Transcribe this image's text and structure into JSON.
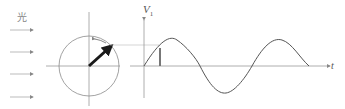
{
  "labels": {
    "light": "光",
    "voltage": "V",
    "voltage_subscript": "1",
    "time": "t"
  },
  "colors": {
    "axis": "#9a9a9a",
    "curve": "#555555",
    "phasor": "#1a1a1a",
    "circle": "#8a8a8a"
  },
  "diagram": {
    "light_rays": 4,
    "phasor_angle_deg": 40,
    "wave_periods": 1.5
  }
}
